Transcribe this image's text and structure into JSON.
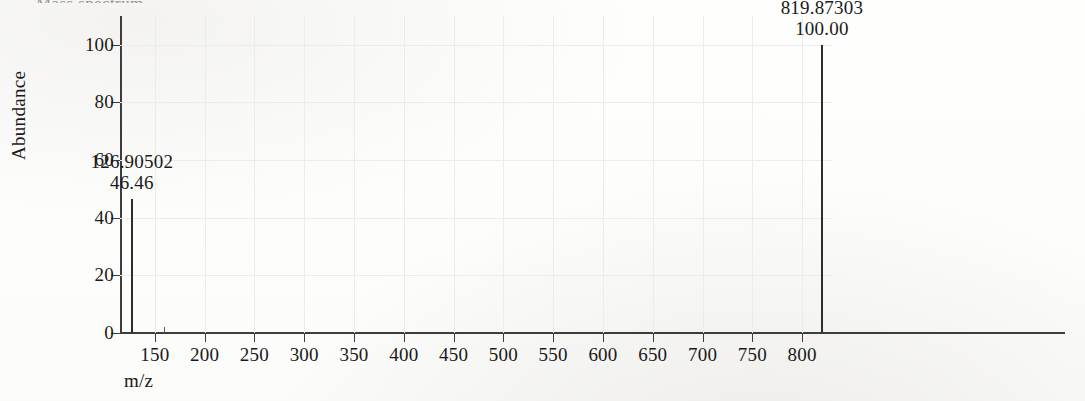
{
  "figure": {
    "cropped_header_text": "Mass spectrum",
    "background_color": "#fdfdfc",
    "axis_color": "#3d3d3d",
    "peak_color": "#2e2e2e",
    "grid_color": "#ececeb"
  },
  "chart_data": {
    "type": "bar",
    "title": "",
    "xlabel": "m/z",
    "ylabel": "Abundance",
    "xlim": [
      115,
      830
    ],
    "ylim": [
      0,
      110
    ],
    "grid": true,
    "legend": null,
    "xticks": [
      150,
      200,
      250,
      300,
      350,
      400,
      450,
      500,
      550,
      600,
      650,
      700,
      750,
      800
    ],
    "yticks": [
      0,
      20,
      40,
      60,
      80,
      100
    ],
    "x": [
      126.90502,
      160.0,
      819.87303
    ],
    "values": [
      46.46,
      2.2,
      100.0
    ],
    "peaks": [
      {
        "mz": 126.90502,
        "abundance": 46.46,
        "mz_label": "126.90502",
        "abundance_label": "46.46",
        "labeled": true,
        "trace": false
      },
      {
        "mz": 160.0,
        "abundance": 2.2,
        "mz_label": "",
        "abundance_label": "",
        "labeled": false,
        "trace": true
      },
      {
        "mz": 819.87303,
        "abundance": 100.0,
        "mz_label": "819.87303",
        "abundance_label": "100.00",
        "labeled": true,
        "trace": false
      }
    ]
  }
}
